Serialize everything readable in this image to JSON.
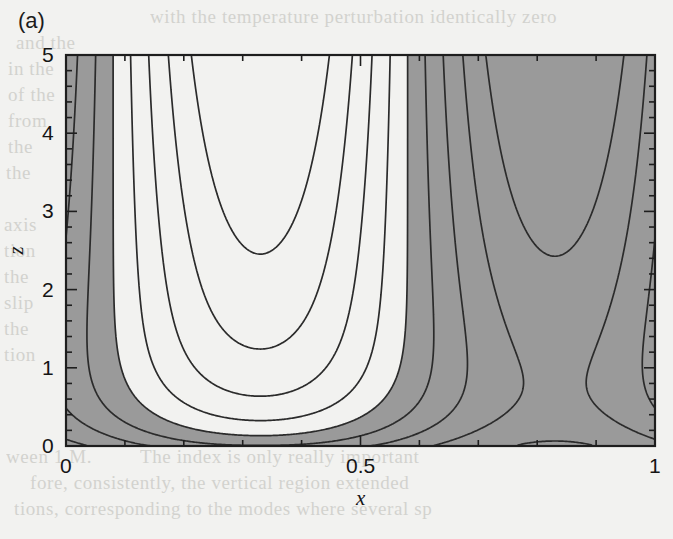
{
  "figure": {
    "panel_label": "(a)",
    "type": "contour",
    "background_color": "#f2f2f0",
    "fill_color": "#9a9a9a",
    "line_color": "#2b2b2b",
    "frame_color": "#1e1e1e"
  },
  "axes": {
    "x": {
      "title": "x",
      "min": 0,
      "max": 1,
      "major_ticks": [
        0,
        0.5,
        1
      ],
      "major_tick_labels": [
        "0",
        "0.5",
        "1"
      ],
      "minor_tick_step": 0.1,
      "tick_direction": "in"
    },
    "z": {
      "title": "z",
      "min": 0,
      "max": 5,
      "major_ticks": [
        0,
        1,
        2,
        3,
        4,
        5
      ],
      "major_tick_labels": [
        "0",
        "1",
        "2",
        "3",
        "4",
        "5"
      ],
      "minor_tick_step": 0.2,
      "tick_direction": "in"
    }
  },
  "chart_data": {
    "type": "contour",
    "title": "",
    "subtitle": "",
    "xlabel": "x",
    "ylabel": "z",
    "xlim": [
      0,
      1
    ],
    "ylim": [
      0,
      5
    ],
    "grid": false,
    "legend": "none",
    "colorbar": false,
    "shading": {
      "style": "two-tone",
      "negative_fill": "#9a9a9a",
      "positive_fill": "#ffffff",
      "description": "Regions where the plotted field is negative are shaded grey; positive regions are left white. Contour lines are drawn at uniform intervals."
    },
    "field_model": {
      "description": "Field reconstructed as f(x,z) = A(z)*cos(2*pi*(x - phi)) - B(z), a single horizontal wavenumber whose amplitude grows with height and whose near-boundary correction produces the thin shaded strip along z = 0.",
      "cell_centers_x": [
        0.33,
        0.85
      ],
      "zero_crossings_x_at_top": [
        0.21,
        0.67
      ],
      "amplitude_growth": "increases with z",
      "boundary_layer_depth_z": 0.45
    },
    "contour_levels": [
      -0.8,
      -0.6,
      -0.4,
      -0.2,
      0.0,
      0.2,
      0.4,
      0.6,
      0.8
    ],
    "contour_interval": 0.2,
    "zero_contour_included": true,
    "features": [
      {
        "name": "left-cell-grey-region",
        "x_range": [
          0.21,
          0.67
        ],
        "description": "Main shaded cell with nested U-shaped contours closing downward about x = 0.33"
      },
      {
        "name": "right-white-region",
        "x_range": [
          0.67,
          1.0
        ],
        "description": "Unshaded cell with nested U-shaped contours about x = 0.85"
      },
      {
        "name": "left-white-region",
        "x_range": [
          0.0,
          0.21
        ],
        "description": "Unshaded sliver at the left wall with steeply rising contours"
      },
      {
        "name": "bottom-grey-strip",
        "z_range": [
          0.0,
          0.45
        ],
        "description": "Thin shaded layer hugging z = 0, pinching out near x = 0.21 and re-forming beyond x = 0.62"
      }
    ]
  },
  "bleed_through": [
    {
      "text": "with the temperature perturbation identically zero",
      "x": 150,
      "y": 6
    },
    {
      "text": "and the",
      "x": 16,
      "y": 32
    },
    {
      "text": "in the",
      "x": 8,
      "y": 58
    },
    {
      "text": "of the",
      "x": 8,
      "y": 84
    },
    {
      "text": "from",
      "x": 8,
      "y": 110
    },
    {
      "text": "the",
      "x": 8,
      "y": 136
    },
    {
      "text": "the",
      "x": 6,
      "y": 162
    },
    {
      "text": "axis",
      "x": 4,
      "y": 214
    },
    {
      "text": "tion",
      "x": 4,
      "y": 240
    },
    {
      "text": "the",
      "x": 4,
      "y": 266
    },
    {
      "text": "slip",
      "x": 4,
      "y": 292
    },
    {
      "text": "the",
      "x": 4,
      "y": 318
    },
    {
      "text": "tion",
      "x": 4,
      "y": 344
    },
    {
      "text": "ween 1 M.",
      "x": 6,
      "y": 446
    },
    {
      "text": "The index is only really important",
      "x": 140,
      "y": 446
    },
    {
      "text": "fore, consistently, the vertical region extended",
      "x": 30,
      "y": 472
    },
    {
      "text": "tions, corresponding to the modes where several sp",
      "x": 14,
      "y": 498
    }
  ]
}
